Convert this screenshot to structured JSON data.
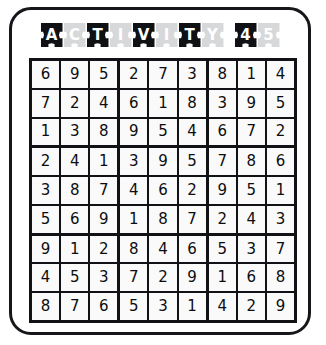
{
  "page": {
    "background_color": "#ffffff",
    "frame_border_color": "#15161a"
  },
  "title": {
    "text": "ACTIVITY 45",
    "dark_tile_color": "#101114",
    "light_tile_color": "#d7d8da",
    "tiles": [
      {
        "char": "A",
        "style": "dark"
      },
      {
        "char": "C",
        "style": "light"
      },
      {
        "char": "T",
        "style": "dark"
      },
      {
        "char": "I",
        "style": "light"
      },
      {
        "char": "V",
        "style": "dark"
      },
      {
        "char": "I",
        "style": "light"
      },
      {
        "char": "T",
        "style": "dark"
      },
      {
        "char": "Y",
        "style": "light"
      },
      {
        "char": " ",
        "style": "gap"
      },
      {
        "char": "4",
        "style": "dark"
      },
      {
        "char": "5",
        "style": "light"
      }
    ]
  },
  "grid": {
    "size": 9,
    "box_size": 3,
    "line_color": "#111216",
    "cell_color": "#fafafa",
    "digit_color": "#0c0d10",
    "rows": [
      [
        6,
        9,
        5,
        2,
        7,
        3,
        8,
        1,
        4
      ],
      [
        7,
        2,
        4,
        6,
        1,
        8,
        3,
        9,
        5
      ],
      [
        1,
        3,
        8,
        9,
        5,
        4,
        6,
        7,
        2
      ],
      [
        2,
        4,
        1,
        3,
        9,
        5,
        7,
        8,
        6
      ],
      [
        3,
        8,
        7,
        4,
        6,
        2,
        9,
        5,
        1
      ],
      [
        5,
        6,
        9,
        1,
        8,
        7,
        2,
        4,
        3
      ],
      [
        9,
        1,
        2,
        8,
        4,
        6,
        5,
        3,
        7
      ],
      [
        4,
        5,
        3,
        7,
        2,
        9,
        1,
        6,
        8
      ],
      [
        8,
        7,
        6,
        5,
        3,
        1,
        4,
        2,
        9
      ]
    ]
  }
}
